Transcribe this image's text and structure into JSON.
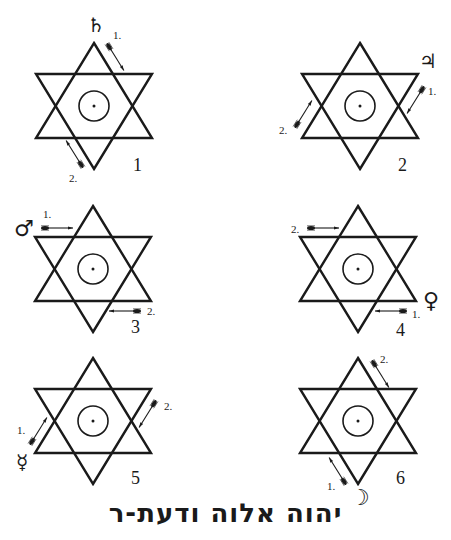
{
  "figure": {
    "caption_hebrew": "יהוה אלוה ודעת-ר",
    "stroke_color": "#1a1a1a",
    "background": "#ffffff"
  },
  "hexagrams": [
    {
      "number": "1",
      "planet": "Saturn",
      "planet_glyph": "♄",
      "step1": "1.",
      "step2": "2."
    },
    {
      "number": "2",
      "planet": "Jupiter",
      "planet_glyph": "♃",
      "step1": "1.",
      "step2": "2."
    },
    {
      "number": "3",
      "planet": "Mars",
      "planet_glyph": "♂",
      "step1": "1.",
      "step2": "2."
    },
    {
      "number": "4",
      "planet": "Venus",
      "planet_glyph": "♀",
      "step1": "1.",
      "step2": "2."
    },
    {
      "number": "5",
      "planet": "Mercury",
      "planet_glyph": "☿",
      "step1": "1.",
      "step2": "2."
    },
    {
      "number": "6",
      "planet": "Moon",
      "planet_glyph": "☽",
      "step1": "1.",
      "step2": "2."
    }
  ]
}
